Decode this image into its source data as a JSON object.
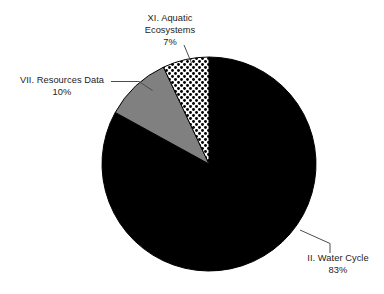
{
  "chart_data": {
    "type": "pie",
    "title": "",
    "categories": [
      "II. Water Cycle",
      "VII. Resources Data",
      "XI. Aquatic Ecosystems"
    ],
    "values": [
      83,
      10,
      7
    ],
    "unit": "%",
    "legend_position": "none",
    "labels_position": "outside-with-leader-lines",
    "slices": [
      {
        "name": "II. Water Cycle",
        "value": 83,
        "value_text": "83%",
        "fill": "#000000",
        "fill_style": "solid-black"
      },
      {
        "name": "VII. Resources Data",
        "value": 10,
        "value_text": "10%",
        "fill": "#808080",
        "fill_style": "solid-gray"
      },
      {
        "name": "XI. Aquatic Ecosystems",
        "value": 7,
        "value_text": "7%",
        "fill": "#ffffff",
        "fill_style": "dotted-stipple-pattern"
      }
    ]
  },
  "labels": {
    "aquatic": {
      "line1": "XI. Aquatic",
      "line2": "Ecosystems",
      "percent": "7%"
    },
    "resources": {
      "name": "VII. Resources Data",
      "percent": "10%"
    },
    "water_cycle": {
      "name": "II. Water Cycle",
      "percent": "83%"
    }
  },
  "colors": {
    "background": "#ffffff",
    "black_slice": "#000000",
    "gray_slice": "#808080",
    "pattern_slice": "#ffffff",
    "outline": "#000000",
    "text": "#1c1c1c",
    "leader_line": "#4d4d4d"
  }
}
